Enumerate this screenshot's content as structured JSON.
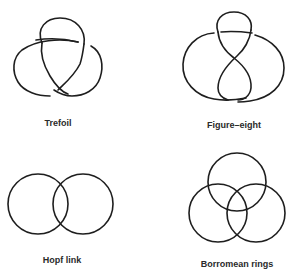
{
  "figure": {
    "panels": [
      {
        "id": "trefoil",
        "label": "Trefoil"
      },
      {
        "id": "figure-eight",
        "label": "Figure–eight"
      },
      {
        "id": "hopf-link",
        "label": "Hopf link"
      },
      {
        "id": "borromean-rings",
        "label": "Borromean rings"
      }
    ]
  },
  "colors": {
    "stroke": "#1e1e1e",
    "label": "#2a2a2a",
    "background": "#ffffff"
  }
}
